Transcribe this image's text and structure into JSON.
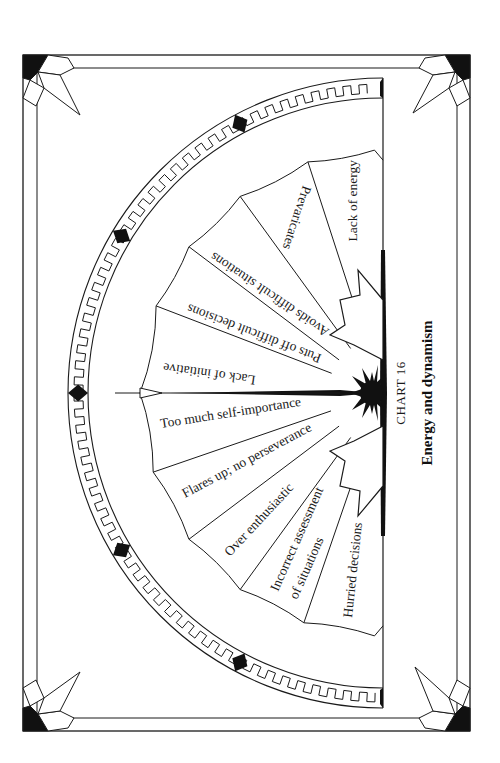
{
  "chart": {
    "number_label": "CHART 16",
    "title": "Energy and dynamism"
  },
  "segments_upper": [
    {
      "label": "Lack of energy"
    },
    {
      "label": "Prevaricates"
    },
    {
      "label": "Avoids difficult situations"
    },
    {
      "label": "Puts off difficult decisions"
    },
    {
      "label": "Lack of initiative"
    }
  ],
  "segments_lower": [
    {
      "label": "Too much self-importance"
    },
    {
      "label": "Flares up; no perseverance"
    },
    {
      "label": "Over enthusiastic"
    },
    {
      "label": "Incorrect assessment",
      "label2": "of situations"
    },
    {
      "label": "Hurried decisions"
    }
  ],
  "colors": {
    "ink": "#1a1a1a",
    "paper": "#ffffff"
  }
}
